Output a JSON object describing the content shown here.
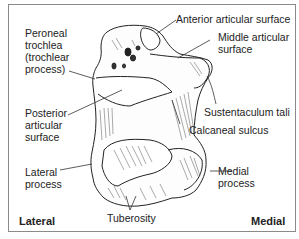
{
  "diagram": {
    "labels": {
      "anterior_articular_surface": "Anterior articular surface",
      "middle_articular_surface_1": "Middle articular",
      "middle_articular_surface_2": "surface",
      "peroneal_trochlea_1": "Peroneal",
      "peroneal_trochlea_2": "trochlea",
      "peroneal_trochlea_3": "(trochlear",
      "peroneal_trochlea_4": "process)",
      "sustentaculum_tali": "Sustentaculum tali",
      "posterior_articular_surface_1": "Posterior",
      "posterior_articular_surface_2": "articular",
      "posterior_articular_surface_3": "surface",
      "calcaneal_sulcus": "Calcaneal sulcus",
      "lateral_process_1": "Lateral",
      "lateral_process_2": "process",
      "medial_process_1": "Medial",
      "medial_process_2": "process",
      "tuberosity": "Tuberosity"
    },
    "orientation": {
      "left": "Lateral",
      "right": "Medial"
    }
  }
}
